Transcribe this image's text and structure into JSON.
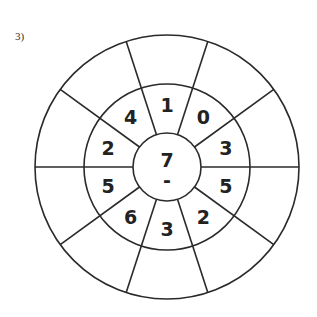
{
  "problem_label": "3)",
  "wheel": {
    "center": {
      "top": "7",
      "bottom": "-"
    },
    "middle_ring_clockwise_from_top": [
      "1",
      "0",
      "3",
      "5",
      "2",
      "3",
      "6",
      "5",
      "2",
      "4"
    ],
    "outer_ring_clockwise_from_top": [
      "",
      "",
      "",
      "",
      "",
      "",
      "",
      "",
      "",
      ""
    ]
  },
  "colors": {
    "line": "#2a2a2a",
    "text": "#222222",
    "background": "#ffffff"
  }
}
